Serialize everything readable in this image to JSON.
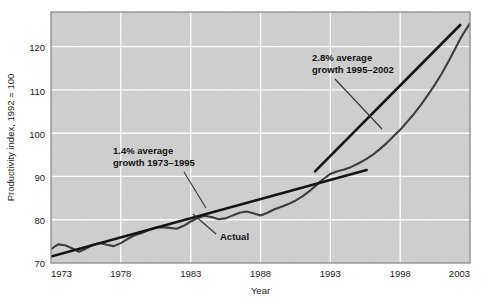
{
  "chart_data": {
    "type": "line",
    "title": "",
    "xlabel": "Year",
    "ylabel": "Productivity index, 1992 = 100",
    "xlim": [
      1973,
      2003
    ],
    "ylim": [
      70,
      128
    ],
    "grid": true,
    "legend_position": "none",
    "xticks": [
      "1973",
      "1978",
      "1983",
      "1988",
      "1993",
      "1998",
      "2003"
    ],
    "xtick_values": [
      1973,
      1978,
      1983,
      1988,
      1993,
      1998,
      2003
    ],
    "yticks": [
      "70",
      "80",
      "90",
      "100",
      "110",
      "120"
    ],
    "ytick_values": [
      70,
      80,
      90,
      100,
      110,
      120
    ],
    "series": [
      {
        "name": "Actual",
        "type": "line",
        "x": [
          1973,
          1973.5,
          1974,
          1974.5,
          1975,
          1975.5,
          1976,
          1976.5,
          1977,
          1977.5,
          1978,
          1978.5,
          1979,
          1979.5,
          1980,
          1980.5,
          1981,
          1981.5,
          1982,
          1982.5,
          1983,
          1983.5,
          1984,
          1984.5,
          1985,
          1985.5,
          1986,
          1986.5,
          1987,
          1987.5,
          1988,
          1988.5,
          1989,
          1989.5,
          1990,
          1990.5,
          1991,
          1991.5,
          1992,
          1992.5,
          1993,
          1993.5,
          1994,
          1994.5,
          1995,
          1995.5,
          1996,
          1996.5,
          1997,
          1997.5,
          1998,
          1998.5,
          1999,
          1999.5,
          2000,
          2000.5,
          2001,
          2001.5,
          2002,
          2002.5,
          2003
        ],
        "y": [
          73.2,
          74.3,
          74.1,
          73.4,
          72.6,
          73.3,
          74.2,
          74.6,
          74.2,
          73.9,
          74.6,
          75.6,
          76.4,
          76.9,
          77.6,
          78.2,
          78.3,
          78.1,
          77.9,
          78.6,
          79.6,
          80.4,
          80.9,
          80.6,
          80.1,
          80.3,
          81.0,
          81.6,
          81.9,
          81.5,
          81.0,
          81.6,
          82.4,
          83.0,
          83.6,
          84.4,
          85.4,
          86.6,
          88.0,
          89.4,
          90.6,
          91.2,
          91.6,
          92.2,
          93.0,
          93.9,
          94.9,
          96.2,
          97.6,
          99.2,
          100.8,
          102.6,
          104.5,
          106.6,
          108.9,
          111.3,
          113.9,
          116.8,
          119.9,
          122.9,
          125.4
        ]
      },
      {
        "name": "1.4% average growth 1973-1995",
        "type": "trendline",
        "x": [
          1973,
          1995.6
        ],
        "y": [
          71.5,
          91.5
        ],
        "growth_rate": "1.4%",
        "period": "1973-1995"
      },
      {
        "name": "2.8% average growth 1995-2002",
        "type": "trendline",
        "x": [
          1991.9,
          2002.3
        ],
        "y": [
          91.2,
          125.0
        ],
        "growth_rate": "2.8%",
        "period": "1995-2002"
      }
    ],
    "annotations": [
      {
        "name": "annotation-growth-1973-1995",
        "line1": "1.4% average",
        "line2": "growth 1973–1995",
        "text_x": 113,
        "text_y": 150,
        "leader": {
          "x1": 184,
          "y1": 163,
          "x2": 206,
          "y2": 206
        }
      },
      {
        "name": "annotation-growth-1995-2002",
        "line1": "2.8% average",
        "line2": "growth 1995–2002",
        "text_x": 312,
        "text_y": 58,
        "leader": {
          "x1": 333,
          "y1": 80,
          "x2": 383,
          "y2": 128
        }
      },
      {
        "name": "annotation-actual",
        "line1": "Actual",
        "text_x": 218,
        "text_y": 237,
        "leader": {
          "x1": 214,
          "y1": 233,
          "x2": 192,
          "y2": 213
        }
      }
    ],
    "colors": {
      "plot_background": "#d6d6d6",
      "gridline": "#fdfdfd",
      "actual_line": "#3c3c3c",
      "trendline": "#141414",
      "axis_border": "#8a8a8a",
      "text": "#1a1a1a",
      "page_background": "#ffffff"
    },
    "plot_box": {
      "left": 51,
      "top": 12,
      "right": 470,
      "bottom": 263
    }
  }
}
